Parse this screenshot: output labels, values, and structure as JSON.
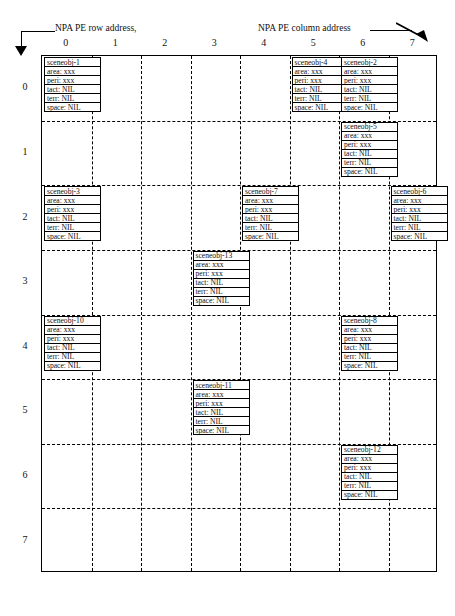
{
  "figure": {
    "title_top_cutoff": "",
    "caption_bottom_cutoff": "",
    "row_axis_label": "NPA  PE row address,",
    "col_axis_label": "NPA  PE column address",
    "column_numbers": [
      "0",
      "1",
      "2",
      "3",
      "4",
      "5",
      "6",
      "7"
    ],
    "row_numbers": [
      "0",
      "1",
      "2",
      "3",
      "4",
      "5",
      "6",
      "7"
    ],
    "grid": {
      "rows": 8,
      "cols": 8
    }
  },
  "field_labels": {
    "area": "area: xxx",
    "peri": "peri: xxx",
    "tact": "tact: NIL",
    "terr": "terr:  NIL",
    "space": "space: NIL"
  },
  "objects": [
    {
      "name": "sceneobj-1",
      "row": 0,
      "col": 0,
      "area": "area: xxx",
      "peri": "peri: xxx",
      "tact": "tact: NIL",
      "terr": "terr:  NIL",
      "space": "space: NIL"
    },
    {
      "name": "sceneobj-4",
      "row": 0,
      "col": 5,
      "area": "area: xxx",
      "peri": "peri: xxx",
      "tact": "tact: NIL",
      "terr": "terr:  NIL",
      "space": "space: NIL"
    },
    {
      "name": "sceneobj-2",
      "row": 0,
      "col": 6,
      "area": "area: xxx",
      "peri": "peri: xxx",
      "tact": "tact: NIL",
      "terr": "terr:  NIL",
      "space": "space: NIL"
    },
    {
      "name": "sceneobj-5",
      "row": 1,
      "col": 6,
      "area": "area: xxx",
      "peri": "peri: xxx",
      "tact": "tact: NIL",
      "terr": "terr:  NIL",
      "space": "space: NIL"
    },
    {
      "name": "sceneobj-3",
      "row": 2,
      "col": 0,
      "area": "area: xxx",
      "peri": "peri: xxx",
      "tact": "tact: NIL",
      "terr": "terr:  NIL",
      "space": "space: NIL"
    },
    {
      "name": "sceneobj-7",
      "row": 2,
      "col": 4,
      "area": "area: xxx",
      "peri": "peri: xxx",
      "tact": "tact: NIL",
      "terr": "terr:  NIL",
      "space": "space: NIL"
    },
    {
      "name": "sceneobj-6",
      "row": 2,
      "col": 7,
      "area": "area: xxx",
      "peri": "peri: xxx",
      "tact": "tact: NIL",
      "terr": "terr:  NIL",
      "space": "space: NIL"
    },
    {
      "name": "sceneobj-13",
      "row": 3,
      "col": 3,
      "area": "area: xxx",
      "peri": "peri: xxx",
      "tact": "tact: NIL",
      "terr": "terr:  NIL",
      "space": "space: NIL"
    },
    {
      "name": "sceneobj-10",
      "row": 4,
      "col": 0,
      "area": "area: xxx",
      "peri": "peri: xxx",
      "tact": "tact: NIL",
      "terr": "terr:  NIL",
      "space": "space: NIL"
    },
    {
      "name": "sceneobj-8",
      "row": 4,
      "col": 6,
      "area": "area: xxx",
      "peri": "peri: xxx",
      "tact": "tact: NIL",
      "terr": "terr:  NIL",
      "space": "space: NIL"
    },
    {
      "name": "sceneobj-11",
      "row": 5,
      "col": 3,
      "area": "area: xxx",
      "peri": "peri: xxx",
      "tact": "tact: NIL",
      "terr": "terr:  NIL",
      "space": "space: NIL"
    },
    {
      "name": "sceneobj-12",
      "row": 6,
      "col": 6,
      "area": "area: xxx",
      "peri": "peri: xxx",
      "tact": "tact: NIL",
      "terr": "terr:  NIL",
      "space": "space: NIL"
    }
  ],
  "colors": {
    "ink": "#000000",
    "paper": "#ffffff"
  }
}
